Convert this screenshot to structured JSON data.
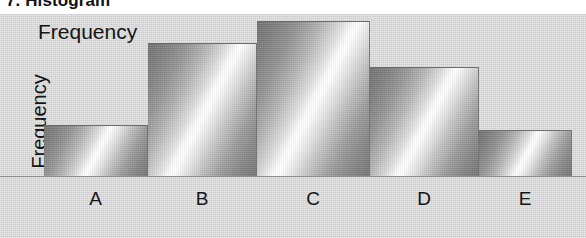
{
  "title": "7. Histogram",
  "figure": {
    "top_label": "Frequency",
    "y_axis_label": "Frequency"
  },
  "colors": {
    "plot_background": "#cdcdcd",
    "bar_light": "#ffffff",
    "bar_dark": "#6f6f6f",
    "baseline": "#8d8d8d",
    "text": "#141414"
  },
  "chart_data": {
    "type": "bar",
    "title": "7. Histogram",
    "xlabel": "",
    "ylabel": "Frequency",
    "categories": [
      "A",
      "B",
      "C",
      "D",
      "E"
    ],
    "values": [
      50,
      132,
      154,
      108,
      45
    ],
    "ylim": [
      0,
      176
    ],
    "grid": false,
    "legend": null,
    "annotations": [
      "Frequency"
    ],
    "bars": [
      {
        "category": "A",
        "value": 50,
        "x": 44,
        "width": 103,
        "top": 140
      },
      {
        "category": "B",
        "value": 132,
        "x": 148,
        "width": 108,
        "top": 58
      },
      {
        "category": "C",
        "value": 154,
        "x": 257,
        "width": 112,
        "top": 36
      },
      {
        "category": "D",
        "value": 108,
        "x": 370,
        "width": 108,
        "top": 82
      },
      {
        "category": "E",
        "value": 45,
        "x": 479,
        "width": 92,
        "top": 145
      }
    ]
  }
}
